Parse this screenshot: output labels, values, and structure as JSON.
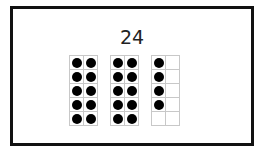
{
  "title": "24",
  "frames": [
    {
      "filled": 10,
      "cells": 10
    },
    {
      "filled": 10,
      "cells": 10
    },
    {
      "filled": 4,
      "cells": 10
    }
  ],
  "colors": {
    "dot": "#000000",
    "grid": "#c8c8c8",
    "border": "#111111"
  }
}
